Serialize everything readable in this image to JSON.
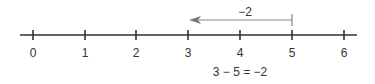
{
  "diagram": {
    "type": "number-line",
    "ticks": [
      {
        "value": 0,
        "label": "0",
        "x": 33
      },
      {
        "value": 1,
        "label": "1",
        "x": 85
      },
      {
        "value": 2,
        "label": "2",
        "x": 136
      },
      {
        "value": 3,
        "label": "3",
        "x": 188
      },
      {
        "value": 4,
        "label": "4",
        "x": 240
      },
      {
        "value": 5,
        "label": "5",
        "x": 292
      },
      {
        "value": 6,
        "label": "6",
        "x": 344
      }
    ],
    "jump": {
      "from": 5,
      "to": 3,
      "label": "−2",
      "direction": "left"
    },
    "equation": "3 − 5 = −2",
    "colors": {
      "line": "#333333",
      "arrow": "#888888",
      "text": "#333333"
    }
  }
}
